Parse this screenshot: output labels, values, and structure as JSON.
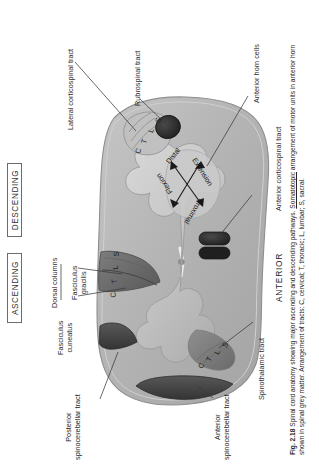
{
  "figure": {
    "number": "Fig. 2.18",
    "caption_line1": "Spinal cord anatomy showing major ascending and descending pathways. ",
    "caption_underlined": "Somatotopic",
    "caption_line2": " arrangement of motor units in anterior horn shown in spinal grey matter. Arrangement of tracts: C, cervical; T, thoracic; L, lumbar; S, sacral."
  },
  "headers": {
    "ascending": "ASCENDING",
    "descending": "DESCENDING"
  },
  "orientation": {
    "anterior": "ANTERIOR"
  },
  "labels": {
    "lateral_corticospinal_tract": "Lateral corticospinal tract",
    "rubrospinal_tract": "Rubrospinal tract",
    "anterior_horn_cells": "Anterior horn cells",
    "anterior_corticospinal_tract": "Anterior corticospinal tract",
    "dorsal_columns": "Dorsal columns",
    "fasciculus_gracilis_l1": "Fasciculus",
    "fasciculus_gracilis_l2": "gracilis",
    "fasciculus_cuneatus_l1": "Fasciculus",
    "fasciculus_cuneatus_l2": "cuneatus",
    "spinothalamic_tract": "Spinothalamic tract",
    "posterior_spinocerebellar_l1": "Posterior",
    "posterior_spinocerebellar_l2": "spinocerebellar tract",
    "anterior_spinocerebellar_l1": "Anterior",
    "anterior_spinocerebellar_l2": "spinocerebellar tract"
  },
  "somatotopy": {
    "distal": "Distal",
    "proximal": "Proximal",
    "flexion": "Flexion",
    "extension": "Extension"
  },
  "tract_letters": {
    "lateral_corticospinal": [
      "C",
      "T",
      "L",
      "S"
    ],
    "dorsal_columns": [
      "C",
      "T",
      "L",
      "S"
    ],
    "spinothalamic": [
      "C",
      "T",
      "L",
      "S"
    ]
  },
  "colors": {
    "white_matter": "#b9b9b9",
    "grey_matter": "#cfcfcf",
    "dark_tract": "#2a2a2a",
    "mid_tract": "#6e6e6e",
    "outline": "#8a8a8a",
    "text": "#262626",
    "page_background": "#ffffff"
  }
}
